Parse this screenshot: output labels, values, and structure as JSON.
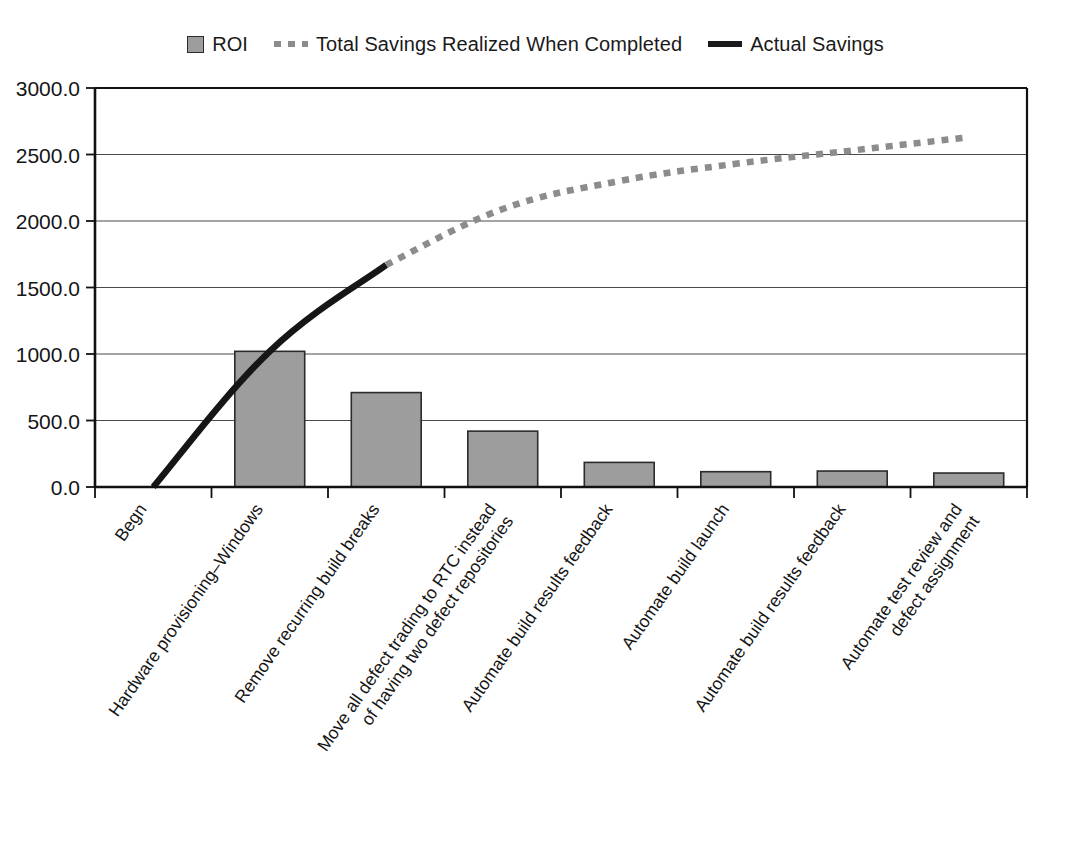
{
  "legend": {
    "position": "top-center",
    "entries": [
      {
        "label": "ROI",
        "marker": "bar-swatch",
        "color": "#9d9d9d"
      },
      {
        "label": "Total Savings Realized When Completed",
        "marker": "dashed-line",
        "color": "#8c8c8c"
      },
      {
        "label": "Actual Savings",
        "marker": "solid-line",
        "color": "#161616"
      }
    ]
  },
  "chart_data": {
    "type": "bar",
    "title": "",
    "subtitle": "",
    "xlabel": "",
    "ylabel": "",
    "ylim": [
      0,
      3000
    ],
    "ytick_labels": [
      "0.0",
      "500.0",
      "1000.0",
      "1500.0",
      "2000.0",
      "2500.0",
      "3000.0"
    ],
    "ytick_values": [
      0,
      500,
      1000,
      1500,
      2000,
      2500,
      3000
    ],
    "grid": true,
    "grid_axis": "y",
    "legend_position": "top-center",
    "categories": [
      "Begn",
      "Hardware provisioning–Windows",
      "Remove recurring build breaks",
      "Move all defect trading to RTC instead\nof having two defect repositories",
      "Automate build results feedback",
      "Automate build launch",
      "Automate build results feedback",
      "Automate test review and\ndefect assignment"
    ],
    "series": [
      {
        "name": "ROI",
        "type": "bar",
        "color": "#9d9d9d",
        "values": [
          0,
          1020,
          710,
          420,
          185,
          115,
          120,
          105
        ]
      },
      {
        "name": "Actual Savings",
        "type": "line",
        "style": "solid",
        "color": "#161616",
        "values": [
          0,
          1020,
          1670,
          null,
          null,
          null,
          null,
          null
        ]
      },
      {
        "name": "Total Savings Realized When Completed",
        "type": "line",
        "style": "dashed",
        "color": "#8c8c8c",
        "values": [
          null,
          null,
          1670,
          2090,
          2300,
          2430,
          2530,
          2630
        ]
      }
    ]
  }
}
